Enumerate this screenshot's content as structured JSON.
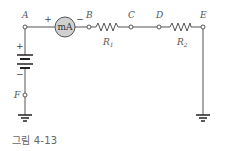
{
  "figure": {
    "caption": "그림 4-13",
    "nodes": {
      "A": "A",
      "B": "B",
      "C": "C",
      "D": "D",
      "E": "E",
      "F": "F"
    },
    "meter": {
      "label": "mA",
      "plus": "+",
      "minus": "−"
    },
    "battery": {
      "plus": "+",
      "minus": "−"
    },
    "resistors": {
      "r1": {
        "main": "R",
        "sub": "1"
      },
      "r2": {
        "main": "R",
        "sub": "2"
      }
    },
    "colors": {
      "wire": "#555555",
      "meter_fill": "#d0d0d0",
      "text": "#555555"
    }
  }
}
